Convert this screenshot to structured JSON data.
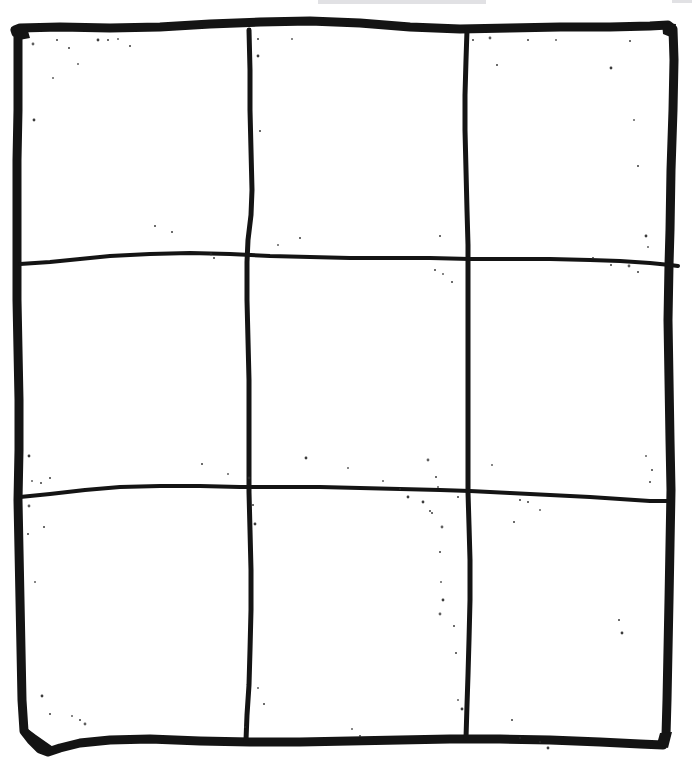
{
  "page": {
    "width": 692,
    "height": 762,
    "background_color": "#ffffff",
    "ink_color": "#141414",
    "speckle_color": "#2b2b2b",
    "smudge_color": "#c9c9cd"
  },
  "grid": {
    "rows": 3,
    "columns": 3,
    "cell_count": 9,
    "style": "hand-drawn",
    "outer_border": {
      "name": "outer-border",
      "stroke_width": 9,
      "top_y": 29,
      "bottom_y": 740,
      "left_x": 18,
      "right_x": 669
    },
    "inner_lines": {
      "vertical_stroke_width": 5,
      "horizontal_stroke_width": 4,
      "vertical_x": [
        250,
        468
      ],
      "horizontal_y": [
        260,
        492
      ]
    },
    "strokes": [
      {
        "name": "outer-border-path",
        "kind": "border",
        "width": 9,
        "d": "M 18 34 L 16 33 L 15 30 L 20 28 L 60 27 L 110 28 L 160 27 L 210 24 L 260 22 L 310 21 L 360 23 L 410 27 L 460 29 L 510 28 L 560 27 L 610 27 L 650 26 L 668 25 L 673 29 L 674 60 L 673 110 L 671 170 L 670 230 L 669 265 L 668 320 L 669 380 L 670 440 L 671 490 L 670 545 L 669 600 L 668 650 L 667 700 L 666 735 L 663 745 L 640 744 L 600 742 L 550 740 L 500 739 L 450 739 L 400 740 L 350 741 L 300 742 L 250 742 L 200 741 L 150 739 L 110 740 L 80 743 L 60 748 L 48 752 L 40 749 L 31 740 L 24 731 L 22 700 L 21 650 L 20 600 L 19 550 L 18 500 L 19 450 L 19 400 L 18 350 L 17 300 L 17 260 L 17 210 L 17 160 L 18 110 L 18 70 Z"
      },
      {
        "name": "vertical-line-1",
        "kind": "inner-vertical",
        "width": 5,
        "d": "M 249 30 L 250 70 L 250 110 L 251 150 L 252 190 L 251 215 L 248 240 L 247 262 L 247 300 L 248 340 L 249 380 L 249 420 L 249 460 L 249 492 L 250 530 L 251 570 L 251 610 L 250 650 L 249 685 L 247 715 L 246 740"
      },
      {
        "name": "vertical-line-2",
        "kind": "inner-vertical",
        "width": 5,
        "d": "M 467 30 L 466 60 L 465 95 L 465 130 L 466 170 L 467 210 L 468 245 L 468 262 L 468 300 L 468 340 L 468 380 L 468 420 L 468 460 L 468 492 L 469 525 L 470 560 L 470 600 L 469 640 L 468 675 L 467 705 L 466 738"
      },
      {
        "name": "horizontal-line-1",
        "kind": "inner-horizontal",
        "width": 4,
        "d": "M 20 264 L 50 262 L 80 259 L 110 256 L 150 254 L 190 253 L 230 254 L 270 256 L 310 257 L 350 258 L 390 258 L 430 258 L 470 259 L 510 259 L 550 259 L 590 260 L 620 261 L 650 263 L 670 265 L 678 266"
      },
      {
        "name": "horizontal-line-2",
        "kind": "inner-horizontal",
        "width": 4,
        "d": "M 20 497 L 50 494 L 85 490 L 120 487 L 160 486 L 200 486 L 240 487 L 280 487 L 320 487 L 360 488 L 400 489 L 440 490 L 470 491 L 510 493 L 550 495 L 590 497 L 620 499 L 650 501 L 668 501"
      }
    ],
    "cells": [
      {
        "name": "cell-top-left",
        "row": 1,
        "col": 1,
        "label": "",
        "occupied": false
      },
      {
        "name": "cell-top-center",
        "row": 1,
        "col": 2,
        "label": "",
        "occupied": false
      },
      {
        "name": "cell-top-right",
        "row": 1,
        "col": 3,
        "label": "",
        "occupied": false
      },
      {
        "name": "cell-middle-left",
        "row": 2,
        "col": 1,
        "label": "",
        "occupied": false
      },
      {
        "name": "cell-middle-center",
        "row": 2,
        "col": 2,
        "label": "",
        "occupied": false
      },
      {
        "name": "cell-middle-right",
        "row": 2,
        "col": 3,
        "label": "",
        "occupied": false
      },
      {
        "name": "cell-bottom-left",
        "row": 3,
        "col": 1,
        "label": "",
        "occupied": false
      },
      {
        "name": "cell-bottom-center",
        "row": 3,
        "col": 2,
        "label": "",
        "occupied": false
      },
      {
        "name": "cell-bottom-right",
        "row": 3,
        "col": 3,
        "label": "",
        "occupied": false
      }
    ]
  },
  "speckles": [
    [
      33,
      44
    ],
    [
      57,
      40
    ],
    [
      69,
      48
    ],
    [
      78,
      64
    ],
    [
      98,
      40
    ],
    [
      108,
      40
    ],
    [
      118,
      39
    ],
    [
      130,
      46
    ],
    [
      34,
      120
    ],
    [
      53,
      78
    ],
    [
      155,
      226
    ],
    [
      172,
      232
    ],
    [
      211,
      254
    ],
    [
      214,
      258
    ],
    [
      258,
      39
    ],
    [
      292,
      39
    ],
    [
      258,
      56
    ],
    [
      260,
      131
    ],
    [
      278,
      245
    ],
    [
      300,
      238
    ],
    [
      306,
      458
    ],
    [
      348,
      468
    ],
    [
      440,
      236
    ],
    [
      473,
      40
    ],
    [
      490,
      38
    ],
    [
      497,
      65
    ],
    [
      528,
      40
    ],
    [
      556,
      40
    ],
    [
      611,
      68
    ],
    [
      630,
      41
    ],
    [
      634,
      120
    ],
    [
      638,
      166
    ],
    [
      646,
      236
    ],
    [
      648,
      247
    ],
    [
      593,
      258
    ],
    [
      611,
      265
    ],
    [
      629,
      266
    ],
    [
      638,
      272
    ],
    [
      202,
      464
    ],
    [
      228,
      474
    ],
    [
      249,
      478
    ],
    [
      435,
      270
    ],
    [
      443,
      274
    ],
    [
      452,
      282
    ],
    [
      29,
      456
    ],
    [
      32,
      481
    ],
    [
      41,
      483
    ],
    [
      50,
      478
    ],
    [
      29,
      506
    ],
    [
      44,
      527
    ],
    [
      28,
      534
    ],
    [
      35,
      582
    ],
    [
      42,
      696
    ],
    [
      50,
      714
    ],
    [
      72,
      716
    ],
    [
      253,
      505
    ],
    [
      255,
      524
    ],
    [
      258,
      688
    ],
    [
      264,
      704
    ],
    [
      245,
      727
    ],
    [
      428,
      460
    ],
    [
      436,
      477
    ],
    [
      458,
      497
    ],
    [
      438,
      487
    ],
    [
      423,
      502
    ],
    [
      430,
      511
    ],
    [
      383,
      481
    ],
    [
      400,
      489
    ],
    [
      408,
      497
    ],
    [
      492,
      465
    ],
    [
      520,
      500
    ],
    [
      432,
      513
    ],
    [
      442,
      527
    ],
    [
      514,
      522
    ],
    [
      440,
      552
    ],
    [
      441,
      582
    ],
    [
      443,
      600
    ],
    [
      528,
      502
    ],
    [
      540,
      510
    ],
    [
      619,
      620
    ],
    [
      622,
      633
    ],
    [
      646,
      456
    ],
    [
      652,
      470
    ],
    [
      650,
      482
    ],
    [
      440,
      614
    ],
    [
      454,
      626
    ],
    [
      456,
      653
    ],
    [
      458,
      700
    ],
    [
      462,
      709
    ],
    [
      512,
      720
    ],
    [
      520,
      738
    ],
    [
      540,
      742
    ],
    [
      548,
      748
    ],
    [
      352,
      729
    ],
    [
      360,
      736
    ],
    [
      80,
      720
    ],
    [
      85,
      724
    ]
  ],
  "artifacts": [
    {
      "name": "scanner-smudge-top",
      "type": "gray-smear",
      "x": 318,
      "y": 0,
      "width": 168,
      "height": 4
    },
    {
      "name": "scanner-edge-top-right",
      "type": "gray-smear",
      "x": 672,
      "y": 0,
      "width": 20,
      "height": 3
    }
  ]
}
